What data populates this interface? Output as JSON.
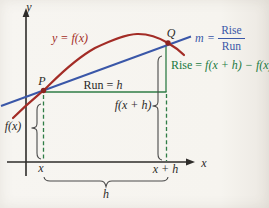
{
  "figure": {
    "title_semantic": "secant-line-slope-diagram",
    "axes": {
      "y_label": "y",
      "x_label": "x"
    },
    "curve": {
      "label": "y = f(x)"
    },
    "points": {
      "p": "P",
      "q": "Q"
    },
    "run": {
      "prefix": "Run = ",
      "var": "h"
    },
    "rise": {
      "prefix": "Rise = ",
      "expr": "f(x + h) − f(x)"
    },
    "slope": {
      "var": "m",
      "equals": "=",
      "numerator": "Rise",
      "denominator": "Run"
    },
    "measures": {
      "fx": "f(x)",
      "fxh": "f(x + h)",
      "h": "h"
    },
    "ticks": {
      "x": "x",
      "x_plus_h": "x + h"
    },
    "colors": {
      "curve": "#a32c26",
      "secant": "#3a57a8",
      "construction": "#2f7d46",
      "annotation_green": "#227a42",
      "axis": "#2e2c2a",
      "brace": "#4a4a4a",
      "background": "#f6f4ef"
    }
  }
}
